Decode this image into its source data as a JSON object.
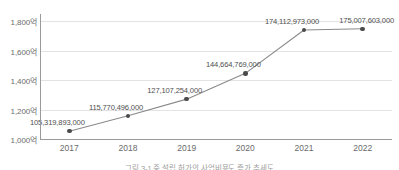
{
  "chart_data": {
    "type": "line",
    "title": "",
    "subtitle": "",
    "xlabel": "",
    "ylabel": "",
    "categories": [
      "2017",
      "2018",
      "2019",
      "2020",
      "2021",
      "2022"
    ],
    "x": [
      2017,
      2018,
      2019,
      2020,
      2021,
      2022
    ],
    "values": [
      105319893000,
      115770496000,
      127107254000,
      144664769000,
      174112973000,
      175007603000
    ],
    "point_labels": [
      "105,319,893,000",
      "115,770,496,000",
      "127,107,254,000",
      "144,664,769,000",
      "174,112,973,000",
      "175,007,603,000"
    ],
    "series": [
      {
        "name": "",
        "values": [
          105319893000,
          115770496000,
          127107254000,
          144664769000,
          174112973000,
          175007603000
        ]
      }
    ],
    "ylim": [
      100000000000,
      185000000000
    ],
    "y_ticks": [
      100000000000,
      120000000000,
      140000000000,
      160000000000,
      180000000000
    ],
    "y_tick_labels": [
      "1,000억",
      "1,200억",
      "1,400억",
      "1,600억",
      "1,800억"
    ],
    "y_unit": "억",
    "grid": true,
    "grid_axis": "y",
    "legend": false,
    "legend_position": "none",
    "marker": "circle",
    "colors": {
      "line": "#8a8a8a",
      "marker": "#4a4a4a",
      "grid": "#e3e3e3",
      "axis": "#9a9a9a",
      "tick_label": "#6b6b6b",
      "data_label": "#4f4f4f",
      "caption": "#9d9d9d",
      "background": "#ffffff"
    }
  },
  "caption": {
    "text": "그림 3-1 중 설립 허가의 사업비용도 증가 추세도"
  }
}
